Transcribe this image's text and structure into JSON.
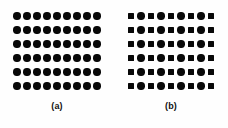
{
  "figure": {
    "background_color": "#fefefe",
    "shape_color": "#080808",
    "panels": [
      {
        "id": "a",
        "caption": "(a)",
        "rows": 6,
        "columns": 9,
        "pattern_description": "uniform lattice of filled circles",
        "grid": [
          [
            "circle",
            "circle",
            "circle",
            "circle",
            "circle",
            "circle",
            "circle",
            "circle",
            "circle"
          ],
          [
            "circle",
            "circle",
            "circle",
            "circle",
            "circle",
            "circle",
            "circle",
            "circle",
            "circle"
          ],
          [
            "circle",
            "circle",
            "circle",
            "circle",
            "circle",
            "circle",
            "circle",
            "circle",
            "circle"
          ],
          [
            "circle",
            "circle",
            "circle",
            "circle",
            "circle",
            "circle",
            "circle",
            "circle",
            "circle"
          ],
          [
            "circle",
            "circle",
            "circle",
            "circle",
            "circle",
            "circle",
            "circle",
            "circle",
            "circle"
          ],
          [
            "circle",
            "circle",
            "circle",
            "circle",
            "circle",
            "circle",
            "circle",
            "circle",
            "circle"
          ]
        ]
      },
      {
        "id": "b",
        "caption": "(b)",
        "rows": 6,
        "columns": 9,
        "pattern_description": "binary lattice alternating filled squares and filled circles, each row beginning and ending with a square",
        "grid": [
          [
            "square",
            "circle",
            "square",
            "circle",
            "square",
            "circle",
            "square",
            "circle",
            "square"
          ],
          [
            "square",
            "circle",
            "square",
            "circle",
            "square",
            "circle",
            "square",
            "circle",
            "square"
          ],
          [
            "square",
            "circle",
            "square",
            "circle",
            "square",
            "circle",
            "square",
            "circle",
            "square"
          ],
          [
            "square",
            "circle",
            "square",
            "circle",
            "square",
            "circle",
            "square",
            "circle",
            "square"
          ],
          [
            "square",
            "circle",
            "square",
            "circle",
            "square",
            "circle",
            "square",
            "circle",
            "square"
          ],
          [
            "square",
            "circle",
            "square",
            "circle",
            "square",
            "circle",
            "square",
            "circle",
            "square"
          ]
        ]
      }
    ]
  }
}
